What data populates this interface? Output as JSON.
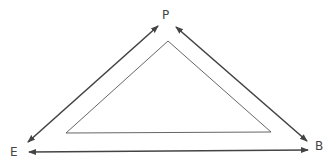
{
  "diagram": {
    "nodes": [
      {
        "id": "P",
        "label": "P",
        "x": 162,
        "y": 9
      },
      {
        "id": "E",
        "label": "E",
        "x": 10,
        "y": 146
      },
      {
        "id": "B",
        "label": "B",
        "x": 315,
        "y": 140
      }
    ],
    "edges": [
      {
        "from": "E",
        "to": "P",
        "type": "double-arrow"
      },
      {
        "from": "P",
        "to": "B",
        "type": "double-arrow"
      },
      {
        "from": "E",
        "to": "B",
        "type": "double-arrow"
      }
    ],
    "inner_triangle": {
      "points": [
        [
          168,
          41
        ],
        [
          66,
          133
        ],
        [
          271,
          132
        ]
      ]
    },
    "colors": {
      "arrow": "#444444",
      "inner": "#555555",
      "text": "#444444"
    }
  }
}
